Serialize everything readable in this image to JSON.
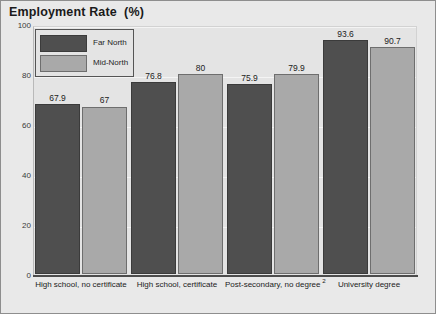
{
  "chart_data": {
    "type": "bar",
    "title": "Employment Rate  (%)",
    "xlabel": "",
    "ylabel": "",
    "ylim": [
      0,
      100
    ],
    "yticks": [
      0,
      20,
      40,
      60,
      80,
      100
    ],
    "ytick_labels": [
      "0",
      "20",
      "40",
      "60",
      "80",
      "100"
    ],
    "grid": true,
    "legend_position": "upper-left inside plot",
    "categories": [
      "High school, no certificate",
      "High school, certificate",
      "Post-secondary, no degree",
      "University degree"
    ],
    "category_footnotes": [
      "",
      "",
      "2",
      ""
    ],
    "series": [
      {
        "name": "Far North",
        "color": "#4f4f4f",
        "values": [
          67.9,
          76.8,
          75.9,
          93.6
        ],
        "value_labels": [
          "67.9",
          "76.8",
          "75.9",
          "93.6"
        ]
      },
      {
        "name": "Mid-North",
        "color": "#a9a9a9",
        "values": [
          67,
          80,
          79.9,
          90.7
        ],
        "value_labels": [
          "67",
          "80",
          "79.9",
          "90.7"
        ]
      }
    ]
  },
  "colors": {
    "far_north": "#4f4f4f",
    "mid_north": "#a9a9a9",
    "plot_background": "#e4e4e4",
    "figure_background": "#e9e9e9",
    "axis": "#4c4c4c"
  }
}
